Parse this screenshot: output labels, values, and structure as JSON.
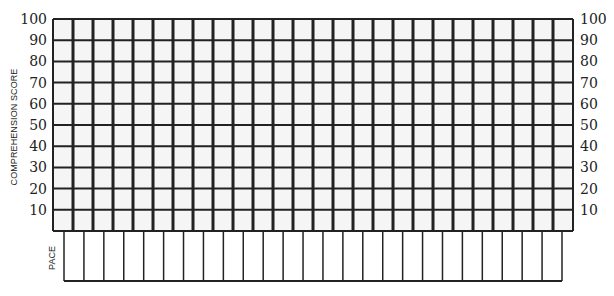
{
  "chart_data": {
    "type": "table",
    "title": "",
    "ylabel": "COMPREHENSION SCORE",
    "row_label_lower": "PACE",
    "y_ticks": [
      100,
      90,
      80,
      70,
      60,
      50,
      40,
      30,
      20,
      10
    ],
    "ylim": [
      0,
      100
    ],
    "grid": true,
    "score_grid": {
      "columns": 26,
      "rows": 10,
      "values": []
    },
    "pace_grid": {
      "columns": 25,
      "rows": 1,
      "values": []
    }
  },
  "layout": {
    "score_grid": {
      "x": 53,
      "y": 19,
      "width": 520,
      "height": 212
    },
    "pace_grid": {
      "x": 64,
      "y": 232,
      "width": 498,
      "height": 49
    },
    "line_color": "#222222",
    "cell_fill": "#f5f5f5"
  }
}
